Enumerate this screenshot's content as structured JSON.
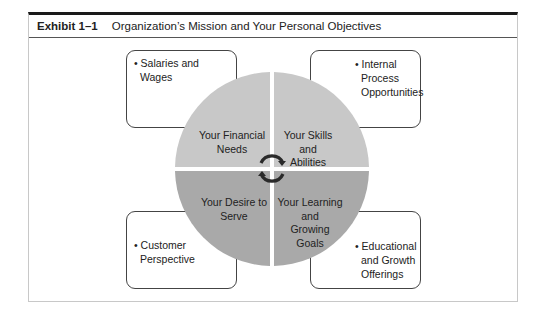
{
  "exhibit": {
    "number": "Exhibit 1–1",
    "title": "Organization’s Mission and Your Personal Objectives"
  },
  "boxes": {
    "top_left": {
      "lines": [
        "• Salaries and",
        "Wages"
      ]
    },
    "top_right": {
      "lines": [
        "• Internal",
        "Process",
        "Opportunities"
      ]
    },
    "bottom_left": {
      "lines": [
        "• Customer",
        "Perspective"
      ]
    },
    "bottom_right": {
      "lines": [
        "• Educational",
        "and Growth",
        "Offerings"
      ]
    }
  },
  "quadrants": {
    "top_left": {
      "lines": [
        "Your Financial",
        "Needs"
      ]
    },
    "top_right": {
      "lines": [
        "Your Skills",
        "and",
        "Abilities"
      ]
    },
    "bottom_left": {
      "lines": [
        "Your Desire to",
        "Serve"
      ]
    },
    "bottom_right": {
      "lines": [
        "Your Learning",
        "and",
        "Growing",
        "Goals"
      ]
    }
  },
  "colors": {
    "top_half": "#c8c8c8",
    "bottom_half": "#a9a9a9",
    "arrows": "#2a2a2a"
  },
  "icons": [
    "cycle-arrows-icon"
  ]
}
